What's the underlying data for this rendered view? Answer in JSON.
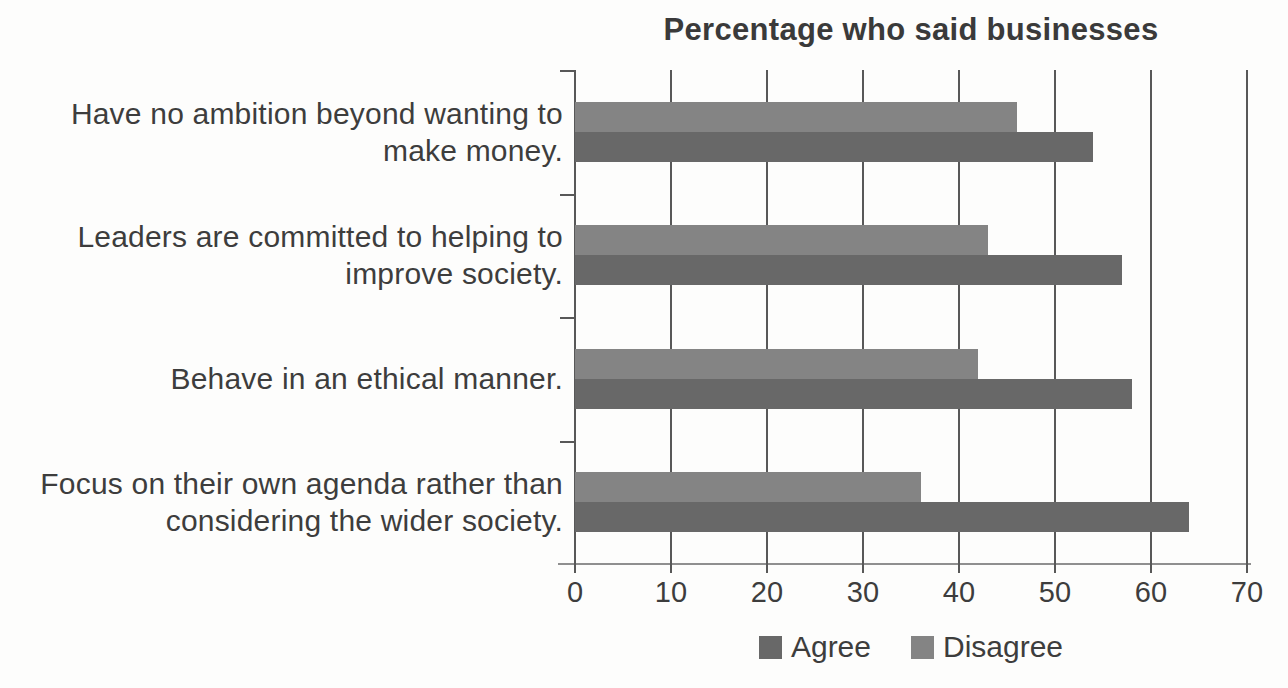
{
  "chart_data": {
    "type": "bar",
    "orientation": "horizontal",
    "title": "Percentage who said businesses",
    "categories": [
      "Have no ambition beyond wanting to make money.",
      "Leaders are committed to helping to improve society.",
      "Behave in an ethical manner.",
      "Focus on their own agenda rather than considering the wider society."
    ],
    "series": [
      {
        "name": "Agree",
        "color": "#686868",
        "values": [
          54,
          57,
          58,
          64
        ]
      },
      {
        "name": "Disagree",
        "color": "#848484",
        "values": [
          46,
          43,
          42,
          36
        ]
      }
    ],
    "bar_order_top_to_bottom": [
      "Disagree",
      "Agree"
    ],
    "xlim": [
      0,
      70
    ],
    "x_ticks": [
      0,
      10,
      20,
      30,
      40,
      50,
      60,
      70
    ],
    "grid": "vertical",
    "legend_position": "bottom",
    "legend_labels": [
      "Agree",
      "Disagree"
    ]
  },
  "colors": {
    "background": "#fdfdfc",
    "text": "#3d3d3d",
    "gridline": "#585858",
    "axis_line": "#8f8f8f",
    "agree": "#686868",
    "disagree": "#848484"
  }
}
